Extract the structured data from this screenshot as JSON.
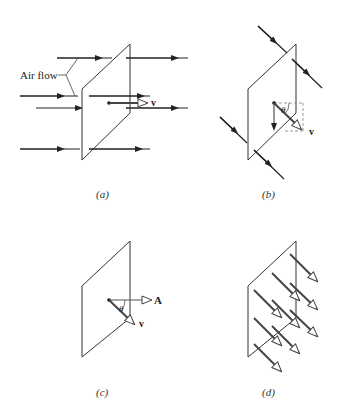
{
  "panels": {
    "a": {
      "caption": "(a)",
      "airflow_label": "Air flow",
      "velocity_label": "v"
    },
    "b": {
      "caption": "(b)",
      "angle_label": "θ",
      "velocity_label": "v"
    },
    "c": {
      "caption": "(c)",
      "angle_label": "θ",
      "area_vector_label": "A",
      "velocity_label": "v"
    },
    "d": {
      "caption": "(d)"
    }
  },
  "colors": {
    "line": "#333333",
    "vector": "#555555",
    "dashed": "#999999"
  }
}
